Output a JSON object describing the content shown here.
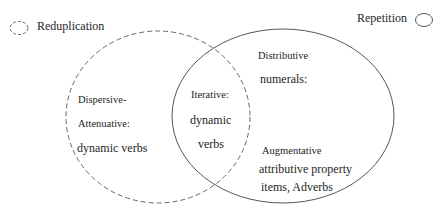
{
  "legend": {
    "reduplication": {
      "label": "Reduplication",
      "icon": "dashed-ellipse-icon"
    },
    "repetition": {
      "label": "Repetition",
      "icon": "solid-ellipse-icon"
    }
  },
  "sets": {
    "reduplication_only": {
      "line1": "Dispersive-",
      "line2": "Attenuative:",
      "line3": "dynamic verbs"
    },
    "intersection": {
      "line1": "Iterative:",
      "line2": "dynamic",
      "line3": "verbs"
    },
    "repetition_only": {
      "group1_line1": "Distributive",
      "group1_line2": "numerals:",
      "group2_line1": "Augmentative",
      "group2_line2": "attributive property",
      "group2_line3": "items, Adverbs"
    }
  },
  "colors": {
    "stroke": "#555555",
    "text": "#1e1e1e"
  }
}
